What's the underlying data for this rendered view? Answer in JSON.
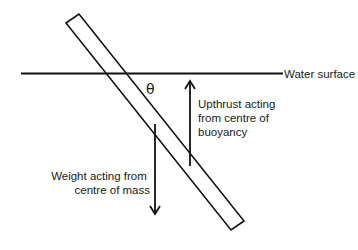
{
  "diagram": {
    "water_surface": {
      "label": "Water surface"
    },
    "angle": {
      "label": "θ"
    },
    "upthrust": {
      "lines": [
        "Upthrust acting",
        "from centre of",
        "buoyancy"
      ]
    },
    "weight": {
      "lines": [
        "Weight acting from",
        "centre of mass"
      ]
    },
    "colors": {
      "stroke": "#111111",
      "background": "#ffffff"
    }
  }
}
